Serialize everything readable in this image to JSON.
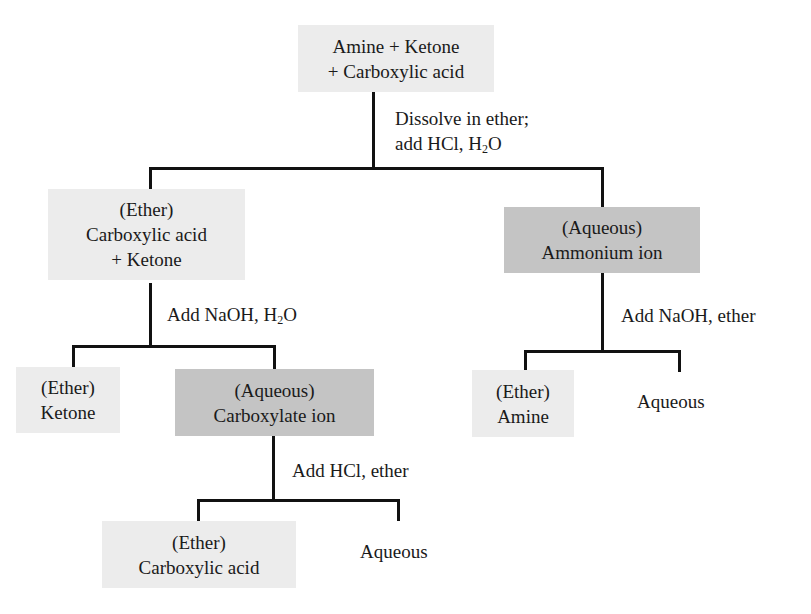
{
  "diagram": {
    "colors": {
      "ether_box": "#ececec",
      "aqueous_box": "#c4c4c4",
      "line": "#111111"
    },
    "root": {
      "line1": "Amine + Ketone",
      "line2": "+ Carboxylic acid"
    },
    "step1": {
      "line1": "Dissolve in ether;",
      "line2_pre": "add HCl, H",
      "line2_sub": "2",
      "line2_post": "O"
    },
    "ether1": {
      "line1": "(Ether)",
      "line2": "Carboxylic acid",
      "line3": "+ Ketone"
    },
    "aqueous1": {
      "line1": "(Aqueous)",
      "line2": "Ammonium ion"
    },
    "step2": {
      "pre": "Add NaOH, H",
      "sub": "2",
      "post": "O"
    },
    "ketone": {
      "line1": "(Ether)",
      "line2": "Ketone"
    },
    "carboxylate": {
      "line1": "(Aqueous)",
      "line2": "Carboxylate ion"
    },
    "step3": {
      "text": "Add HCl, ether"
    },
    "acid": {
      "line1": "(Ether)",
      "line2": "Carboxylic acid"
    },
    "aqueous3": {
      "text": "Aqueous"
    },
    "step4": {
      "text": "Add NaOH, ether"
    },
    "amine": {
      "line1": "(Ether)",
      "line2": "Amine"
    },
    "aqueous4": {
      "text": "Aqueous"
    }
  }
}
